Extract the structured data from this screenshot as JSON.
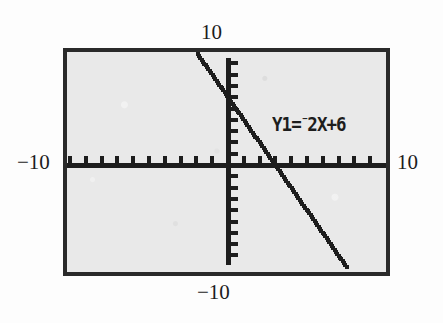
{
  "figure": {
    "kind": "graphing-calculator-screen",
    "equation_label": {
      "prefix": "Y1=",
      "negation": "⁻",
      "expression": "2X+6",
      "full_text": "Y1=-2X+6"
    },
    "range_labels": {
      "ymax": "10",
      "xmin": "−10",
      "xmax": "10",
      "ymin": "−10"
    },
    "colors": {
      "ink": "#1d1d1d",
      "screen_background": "#e9e9e9",
      "frame": "#2a2a2a",
      "page": "#fdfdfd"
    }
  },
  "chart_data": {
    "type": "line",
    "title": "",
    "xlabel": "",
    "ylabel": "",
    "xlim": [
      -10,
      10
    ],
    "ylim": [
      -10,
      10
    ],
    "xtick_interval": 1,
    "ytick_interval": 1,
    "grid": false,
    "legend": "none",
    "annotations": [
      "Y1=-2X+6"
    ],
    "series": [
      {
        "name": "Y1=-2X+6",
        "equation": "y = -2x + 6",
        "slope": -2,
        "intercept": 6,
        "style": "dotted-pixel-trace",
        "x": [
          -2,
          -1,
          0,
          1,
          2,
          3,
          4,
          5,
          6,
          7,
          8
        ],
        "values": [
          10,
          8,
          6,
          4,
          2,
          0,
          -2,
          -4,
          -6,
          -8,
          -10
        ]
      }
    ],
    "key_points": {
      "y_intercept": [
        0,
        6
      ],
      "x_intercept": [
        3,
        0
      ]
    }
  }
}
